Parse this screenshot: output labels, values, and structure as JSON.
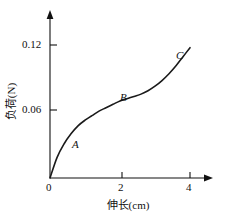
{
  "chart_data": {
    "type": "line",
    "title": "",
    "xlabel": "伸长(cm)",
    "ylabel": "负荷(N)",
    "xlim": [
      0,
      4.6
    ],
    "ylim": [
      0,
      0.134
    ],
    "xticks": [
      "0",
      "2",
      "4"
    ],
    "xtick_values": [
      0,
      2,
      4
    ],
    "yticks": [
      "0.06",
      "0.12"
    ],
    "ytick_values": [
      0.06,
      0.12
    ],
    "grid": false,
    "legend": null,
    "axis_arrows": {
      "x": "right-arrow-icon",
      "y": "up-arrow-icon"
    },
    "series": [
      {
        "name": "load-extension-curve",
        "x": [
          0.0,
          0.2,
          0.4,
          0.6,
          0.8,
          1.0,
          1.2,
          1.4,
          1.6,
          1.8,
          2.0,
          2.2,
          2.4,
          2.6,
          2.8,
          3.0,
          3.2,
          3.4,
          3.6,
          3.8,
          4.0
        ],
        "y": [
          0.0,
          0.018,
          0.03,
          0.039,
          0.046,
          0.051,
          0.055,
          0.059,
          0.062,
          0.065,
          0.068,
          0.07,
          0.072,
          0.074,
          0.077,
          0.081,
          0.086,
          0.092,
          0.099,
          0.107,
          0.115
        ]
      }
    ],
    "annotations": [
      {
        "label": "A",
        "x": 1.0,
        "y": 0.051
      },
      {
        "label": "B",
        "x": 2.2,
        "y": 0.07
      },
      {
        "label": "C",
        "x": 3.85,
        "y": 0.112
      }
    ]
  },
  "axes": {
    "x_title": "伸长(cm)",
    "y_title": "负荷(N)",
    "x_tick_0": "0",
    "x_tick_2": "2",
    "x_tick_4": "4",
    "y_tick_006": "0.06",
    "y_tick_012": "0.12"
  },
  "points": {
    "a": "A",
    "b": "B",
    "c": "C"
  }
}
